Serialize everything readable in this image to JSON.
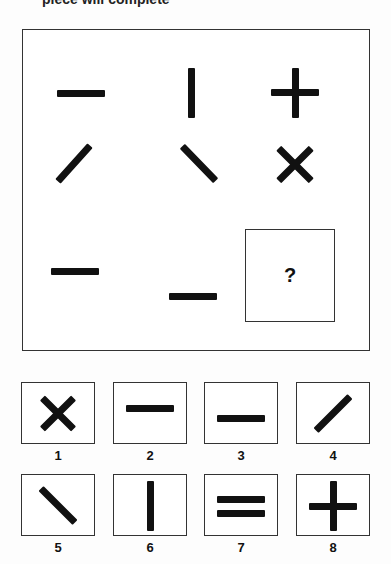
{
  "header": {
    "cut_off_text": "piece will complete"
  },
  "puzzle": {
    "grid": [
      [
        "horizontal-dash",
        "vertical-bar",
        "plus"
      ],
      [
        "slash",
        "backslash",
        "x-cross"
      ],
      [
        "horizontal-dash",
        "low-horizontal-dash",
        "missing"
      ]
    ],
    "missing_label": "?"
  },
  "options": [
    {
      "number": "1",
      "shape": "x-cross"
    },
    {
      "number": "2",
      "shape": "high-horizontal-dash"
    },
    {
      "number": "3",
      "shape": "low-horizontal-dash"
    },
    {
      "number": "4",
      "shape": "slash"
    },
    {
      "number": "5",
      "shape": "backslash"
    },
    {
      "number": "6",
      "shape": "vertical-bar"
    },
    {
      "number": "7",
      "shape": "equals"
    },
    {
      "number": "8",
      "shape": "plus"
    }
  ],
  "colors": {
    "ink": "#111111",
    "border": "#333333",
    "background": "#ffffff"
  }
}
